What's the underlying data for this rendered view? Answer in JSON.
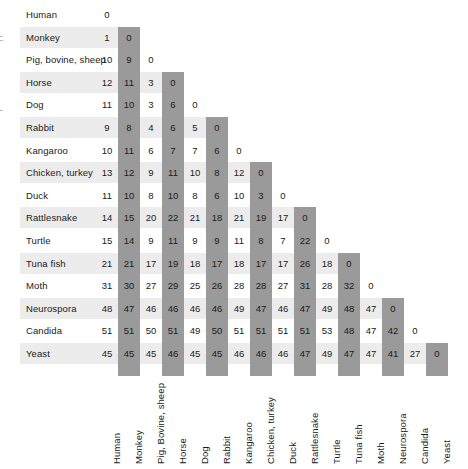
{
  "figure": {
    "type": "matrix-table",
    "colors": {
      "row_band": "#ececec",
      "col_band": "#9a9a9a",
      "background": "#ffffff",
      "text": "#1a1a1a"
    }
  },
  "chart_data": {
    "type": "heatmap",
    "title": "",
    "xlabel": "",
    "ylabel": "",
    "grid": false,
    "legend": "none",
    "row_labels": [
      "Human",
      "Monkey",
      "Pig, bovine, sheep",
      "Horse",
      "Dog",
      "Rabbit",
      "Kangaroo",
      "Chicken, turkey",
      "Duck",
      "Rattlesnake",
      "Turtle",
      "Tuna fish",
      "Moth",
      "Neurospora",
      "Candida",
      "Yeast"
    ],
    "column_labels": [
      "Human",
      "Monkey",
      "Pig, Bovine, sheep",
      "Horse",
      "Dog",
      "Rabbit",
      "Kangaroo",
      "Chicken, turkey",
      "Duck",
      "Rattlesnake",
      "Turtle",
      "Tuna fish",
      "Moth",
      "Neurospora",
      "Candida",
      "Yeast"
    ],
    "shaded_columns": [
      1,
      3,
      5,
      7,
      9,
      11,
      13,
      15
    ],
    "shaded_rows": [
      1,
      3,
      5,
      7,
      9,
      11,
      13,
      15
    ],
    "values": [
      [
        0
      ],
      [
        1,
        0
      ],
      [
        10,
        9,
        0
      ],
      [
        12,
        11,
        3,
        0
      ],
      [
        11,
        10,
        3,
        6,
        0
      ],
      [
        9,
        8,
        4,
        6,
        5,
        0
      ],
      [
        10,
        11,
        6,
        7,
        7,
        6,
        0
      ],
      [
        13,
        12,
        9,
        11,
        10,
        8,
        12,
        0
      ],
      [
        11,
        10,
        8,
        10,
        8,
        6,
        10,
        3,
        0
      ],
      [
        14,
        15,
        20,
        22,
        21,
        18,
        21,
        19,
        17,
        0
      ],
      [
        15,
        14,
        9,
        11,
        9,
        9,
        11,
        8,
        7,
        22,
        0
      ],
      [
        21,
        21,
        17,
        19,
        18,
        17,
        18,
        17,
        17,
        26,
        18,
        0
      ],
      [
        31,
        30,
        27,
        29,
        25,
        26,
        28,
        28,
        27,
        31,
        28,
        32,
        0
      ],
      [
        48,
        47,
        46,
        46,
        46,
        46,
        49,
        47,
        46,
        47,
        49,
        48,
        47,
        0
      ],
      [
        51,
        51,
        50,
        51,
        49,
        50,
        51,
        51,
        51,
        51,
        53,
        48,
        47,
        42,
        0
      ],
      [
        45,
        45,
        45,
        46,
        45,
        45,
        46,
        46,
        46,
        47,
        49,
        47,
        47,
        41,
        27,
        0
      ]
    ]
  }
}
